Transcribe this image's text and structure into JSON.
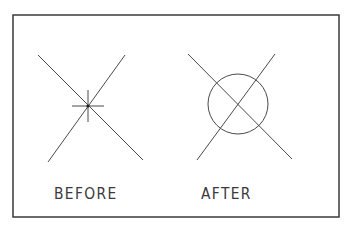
{
  "figure": {
    "frame": {
      "x": 13,
      "y": 15,
      "width": 326,
      "height": 202,
      "stroke": "#3a3a3a"
    },
    "panels": [
      {
        "id": "before",
        "label": "BEFORE",
        "label_pos": {
          "x": 54,
          "y": 187
        },
        "lines": [
          {
            "x1": 38,
            "y1": 55,
            "x2": 143,
            "y2": 160
          },
          {
            "x1": 125,
            "y1": 55,
            "x2": 48,
            "y2": 162
          }
        ],
        "crosshair": {
          "cx": 88,
          "cy": 106,
          "half_h": 16,
          "half_v": 16
        },
        "point": {
          "cx": 88,
          "cy": 106
        }
      },
      {
        "id": "after",
        "label": "AFTER",
        "label_pos": {
          "x": 201,
          "y": 187
        },
        "lines": [
          {
            "x1": 188,
            "y1": 54,
            "x2": 292,
            "y2": 159
          },
          {
            "x1": 275,
            "y1": 54,
            "x2": 197,
            "y2": 160
          }
        ],
        "circle": {
          "cx": 238,
          "cy": 104,
          "r": 30
        }
      }
    ],
    "line_color": "#4a4a4a"
  }
}
